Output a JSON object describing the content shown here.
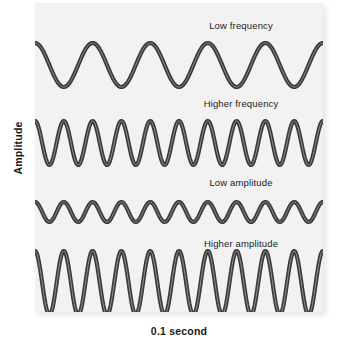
{
  "figure": {
    "y_axis_label": "Amplitude",
    "x_axis_label": "0.1 second",
    "panel_color": "#f2f2f2",
    "wave_color": "#3a3a3a",
    "wave_highlight_color": "#8f8f8f",
    "text_color": "#1b1b1b"
  },
  "chart_data": {
    "type": "line",
    "title": "",
    "xlabel": "0.1 second",
    "ylabel": "Amplitude",
    "grid": false,
    "legend_position": "none",
    "xlim": [
      0,
      0.1
    ],
    "series": [
      {
        "name": "Low frequency",
        "label": "Low frequency",
        "cycles": 5,
        "amplitude_relative": 1.0,
        "baseline_y": 62,
        "amplitude_px": 22,
        "note": "5 cycles in 0.1 second = 50 Hz, medium amplitude"
      },
      {
        "name": "Higher frequency",
        "label": "Higher frequency",
        "cycles": 10,
        "amplitude_relative": 1.0,
        "baseline_y": 140,
        "amplitude_px": 22,
        "note": "10 cycles in 0.1 second = 100 Hz, same amplitude as low frequency"
      },
      {
        "name": "Low amplitude",
        "label": "Low amplitude",
        "cycles": 10,
        "amplitude_relative": 0.45,
        "baseline_y": 209,
        "amplitude_px": 10,
        "note": "10 cycles, reduced amplitude"
      },
      {
        "name": "Higher amplitude",
        "label": "Higher amplitude",
        "cycles": 10,
        "amplitude_relative": 1.45,
        "baseline_y": 280,
        "amplitude_px": 32,
        "note": "10 cycles, largest amplitude"
      }
    ]
  }
}
